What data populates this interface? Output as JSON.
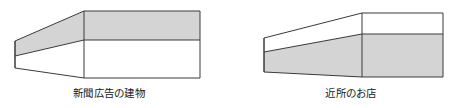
{
  "canvas": {
    "width": 460,
    "height": 108,
    "background": "#ffffff"
  },
  "style": {
    "stroke_color": "#3a3a3a",
    "stroke_width": 1,
    "fill_gray": "#d4d4d4",
    "fill_white": "#ffffff",
    "caption_color": "#1a1a1a"
  },
  "figures": [
    {
      "id": "figure-left",
      "caption": "新聞広告の建物",
      "shaded_region": "top",
      "geometry": {
        "near_edge_x": 15,
        "near_top_y": 41,
        "near_mid_y": 56,
        "near_bottom_y": 68,
        "corner_x": 84,
        "corner_top_y": 11,
        "corner_mid_y": 40,
        "corner_bottom_y": 78,
        "far_edge_x": 200,
        "far_top_y": 11,
        "far_mid_y": 40,
        "far_bottom_y": 78
      }
    },
    {
      "id": "figure-right",
      "caption": "近所のお店",
      "shaded_region": "bottom",
      "geometry": {
        "near_edge_x": 264,
        "near_top_y": 38,
        "near_mid_y": 52,
        "near_bottom_y": 72,
        "corner_x": 362,
        "corner_top_y": 13,
        "corner_mid_y": 34,
        "corner_bottom_y": 77,
        "far_edge_x": 443,
        "far_top_y": 13,
        "far_mid_y": 34,
        "far_bottom_y": 77
      }
    }
  ]
}
